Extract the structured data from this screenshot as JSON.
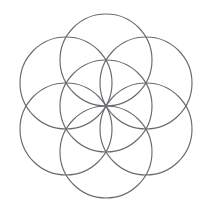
{
  "figure": {
    "type": "geometric-line-drawing",
    "canvas": {
      "width": 211,
      "height": 215,
      "background_color": "#ffffff"
    },
    "stroke": {
      "color": "#6a6a70",
      "width": 1.15,
      "fill": "none"
    },
    "construction": {
      "center": {
        "x": 106,
        "y": 106
      },
      "radius": 46,
      "circle_count": 7,
      "angular_step_degrees": 60,
      "bounds": {
        "left": 20,
        "top": 14,
        "right": 192,
        "bottom": 198
      }
    },
    "circles": [
      {
        "name": "center-circle",
        "cx": 106,
        "cy": 106,
        "r": 46,
        "angle_degrees": null
      },
      {
        "name": "circle-top",
        "cx": 106,
        "cy": 60,
        "r": 46,
        "angle_degrees": 270
      },
      {
        "name": "circle-upper-right",
        "cx": 146,
        "cy": 83,
        "r": 46,
        "angle_degrees": 330
      },
      {
        "name": "circle-lower-right",
        "cx": 146,
        "cy": 129,
        "r": 46,
        "angle_degrees": 30
      },
      {
        "name": "circle-bottom",
        "cx": 106,
        "cy": 152,
        "r": 46,
        "angle_degrees": 90
      },
      {
        "name": "circle-lower-left",
        "cx": 66,
        "cy": 129,
        "r": 46,
        "angle_degrees": 150
      },
      {
        "name": "circle-upper-left",
        "cx": 66,
        "cy": 83,
        "r": 46,
        "angle_degrees": 210
      }
    ]
  }
}
